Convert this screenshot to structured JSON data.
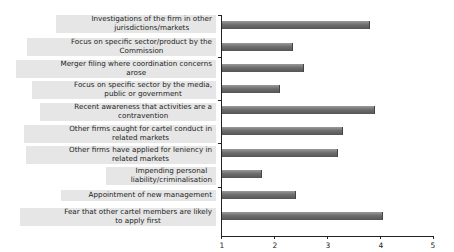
{
  "chart_data": {
    "type": "bar",
    "orientation": "horizontal",
    "title": "",
    "xlabel": "",
    "ylabel": "",
    "xlim": [
      1,
      5
    ],
    "x_ticks": [
      "1",
      "2",
      "3",
      "4",
      "5"
    ],
    "grid": false,
    "legend": null,
    "categories": [
      "Investigations of the firm in other jurisdictions/markets",
      "Focus on specific sector/product by the Commission",
      "Merger filing where coordination concerns arose",
      "Focus on specific sector by the media, public or government",
      "Recent awareness that activities are a contravention",
      "Other firms caught for cartel conduct in related markets",
      "Other firms have applied for leniency in related markets",
      "Impending personal liability/criminalisation",
      "Appointment of new management",
      "Fear that other cartel members are likely to apply first"
    ],
    "values": [
      3.8,
      2.35,
      2.55,
      2.1,
      3.9,
      3.3,
      3.2,
      1.75,
      2.4,
      4.05
    ]
  },
  "labels": [
    {
      "line1": "Investigations of the firm in other",
      "line2": "jurisdictions/markets"
    },
    {
      "line1": "Focus on specific sector/product by the",
      "line2": "Commission"
    },
    {
      "line1": "Merger filing where coordination concerns",
      "line2": "arose"
    },
    {
      "line1": "Focus on specific sector by the media,",
      "line2": "public or government"
    },
    {
      "line1": "Recent awareness that activities are a",
      "line2": "contravention"
    },
    {
      "line1": "Other firms caught for cartel conduct in",
      "line2": "related markets"
    },
    {
      "line1": "Other firms have applied for leniency in",
      "line2": "related markets"
    },
    {
      "line1": "Impending personal",
      "line2": "liability/criminalisation"
    },
    {
      "line1": "Appointment of new management",
      "line2": ""
    },
    {
      "line1": "Fear that other cartel members are likely",
      "line2": "to apply first"
    }
  ],
  "ticks": [
    "1",
    "2",
    "3",
    "4",
    "5"
  ]
}
